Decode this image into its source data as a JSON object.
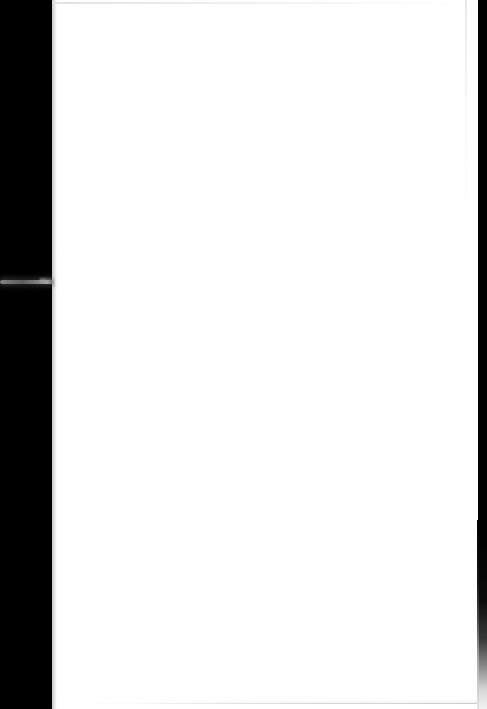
{
  "document": {
    "kind": "scanned-page",
    "page_content": "",
    "page_text": "",
    "is_blank": "true"
  },
  "canvas": {
    "width": 487,
    "height": 709,
    "background_color": "#000000"
  },
  "page": {
    "label": "",
    "background_color": "#ffffff",
    "left": 52,
    "top": 0,
    "width": 426,
    "height": 709
  },
  "bezel": {
    "color": "#000000",
    "left_width": 52,
    "right_start_x": 478,
    "right_width": 9
  },
  "artifacts": {
    "gutter_streak": {
      "name": "grey scan streak",
      "color": "#8a8a8a",
      "y": 282,
      "x_start": 0,
      "x_end": 54
    },
    "top_hairline": {
      "name": "top edge scan line",
      "color": "#e9e9e9",
      "y": 3
    },
    "right_vertical_hairline": {
      "name": "right vertical scan line",
      "color": "#eeeeee",
      "x": 465
    },
    "bottom_hairline": {
      "name": "bottom edge scan line",
      "color": "#d6d6d6",
      "y": 703,
      "x_start": 145
    }
  }
}
